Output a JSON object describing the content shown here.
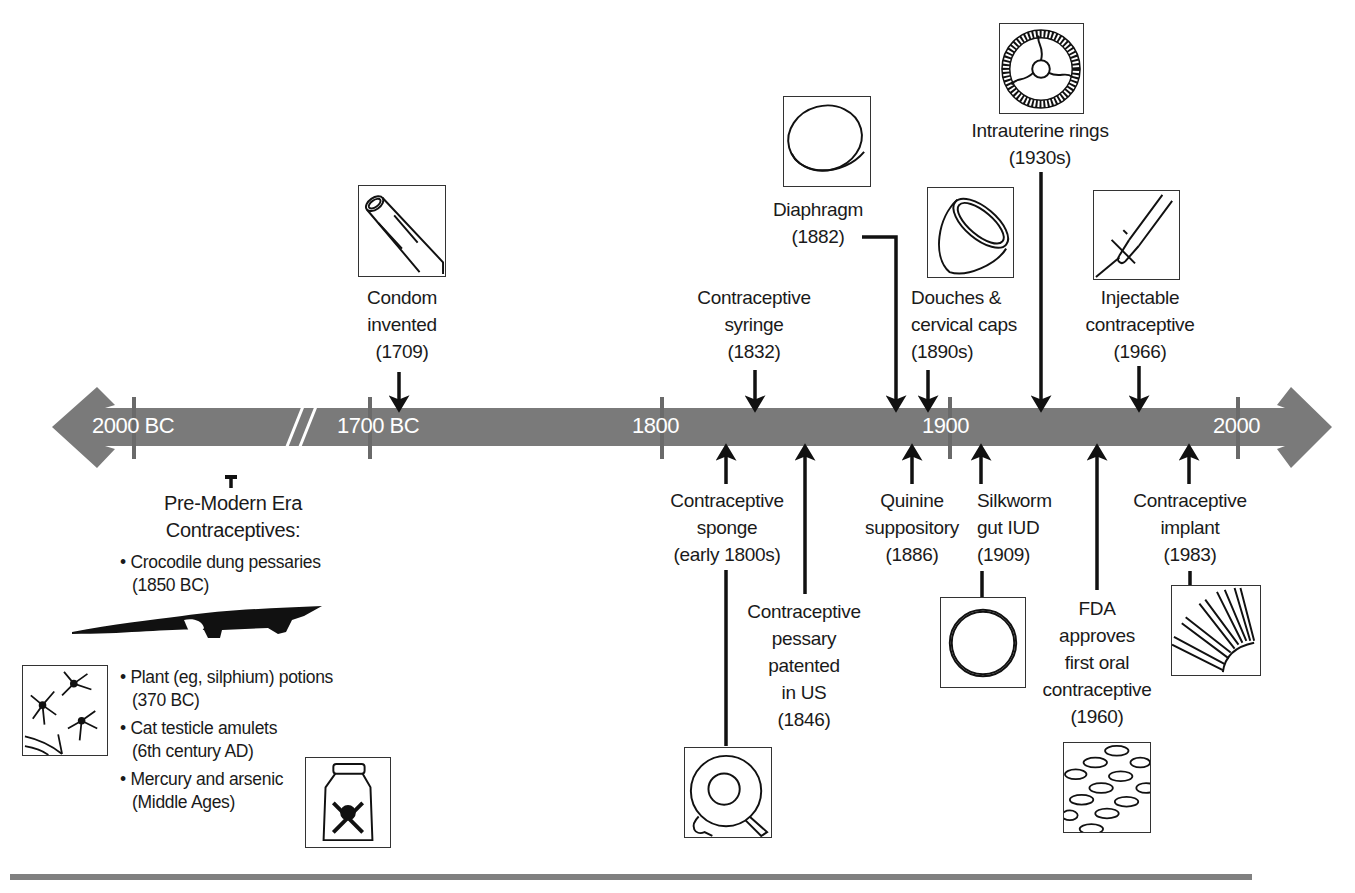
{
  "timeline": {
    "bar_color": "#7a7a7a",
    "tick_color": "#6a6a6a",
    "axis_ticks": [
      {
        "label": "2000 BC",
        "x": 134
      },
      {
        "label": "1700 BC",
        "x": 370
      },
      {
        "label": "1800",
        "x": 662
      },
      {
        "label": "1900",
        "x": 950
      },
      {
        "label": "2000",
        "x": 1238
      }
    ],
    "break_mark": "//"
  },
  "events_above": [
    {
      "id": "condom",
      "label": "Condom\ninvented\n(1709)",
      "year": "1709",
      "icon": "condom-icon"
    },
    {
      "id": "syringe",
      "label": "Contraceptive\nsyringe\n(1832)",
      "year": "1832",
      "icon": null
    },
    {
      "id": "diaphragm",
      "label": "Diaphragm\n(1882)",
      "year": "1882",
      "icon": "diaphragm-icon"
    },
    {
      "id": "douches",
      "label": "Douches &\ncervical caps\n(1890s)",
      "year": "1890s",
      "icon": "cervical-cap-icon"
    },
    {
      "id": "rings",
      "label": "Intrauterine rings\n(1930s)",
      "year": "1930s",
      "icon": "intrauterine-ring-icon"
    },
    {
      "id": "injectable",
      "label": "Injectable\ncontraceptive\n(1966)",
      "year": "1966",
      "icon": "syringe-icon"
    }
  ],
  "events_below": [
    {
      "id": "sponge",
      "label": "Contraceptive\nsponge\n(early 1800s)",
      "year": "early 1800s",
      "icon": "sponge-icon"
    },
    {
      "id": "pessary",
      "label": "Contraceptive\npessary\npatented\nin US\n(1846)",
      "year": "1846",
      "icon": null
    },
    {
      "id": "quinine",
      "label": "Quinine\nsuppository\n(1886)",
      "year": "1886",
      "icon": null
    },
    {
      "id": "silkworm",
      "label": "Silkworm\ngut IUD\n(1909)",
      "year": "1909",
      "icon": "iud-ring-icon"
    },
    {
      "id": "fda",
      "label": "FDA\napproves\nfirst oral\ncontraceptive\n(1960)",
      "year": "1960",
      "icon": "pills-icon"
    },
    {
      "id": "implant",
      "label": "Contraceptive\nimplant\n(1983)",
      "year": "1983",
      "icon": "implant-rods-icon"
    }
  ],
  "pre_modern": {
    "heading": "Pre-Modern Era\nContraceptives:",
    "items": [
      {
        "text": "Crocodile dung pessaries\n(1850 BC)",
        "icon": "crocodile-icon"
      },
      {
        "text": "Plant (eg, silphium) potions\n(370 BC)",
        "icon": "lily-flower-icon"
      },
      {
        "text": "Cat testicle amulets\n(6th century AD)",
        "icon": null
      },
      {
        "text": "Mercury and arsenic\n(Middle Ages)",
        "icon": "poison-bottle-icon"
      }
    ]
  }
}
